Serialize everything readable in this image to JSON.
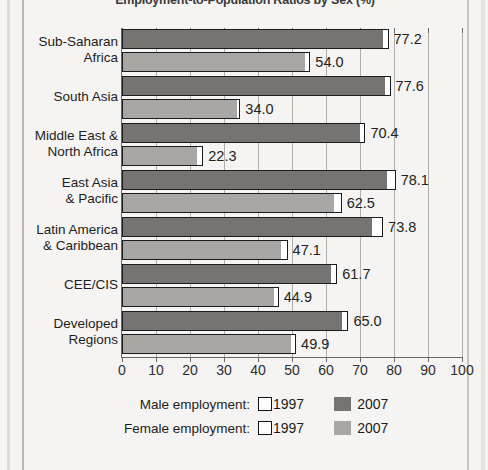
{
  "chart_title": "Employment-to-Population Ratios by Sex (%)",
  "chart_data": {
    "type": "bar",
    "orientation": "horizontal",
    "title": "Employment-to-Population Ratios by Sex (%)",
    "xlabel": "",
    "ylabel": "",
    "xlim": [
      0,
      100
    ],
    "xticks": [
      0,
      10,
      20,
      30,
      40,
      50,
      60,
      70,
      80,
      90,
      100
    ],
    "grid": true,
    "grid_axis": "x",
    "legend_position": "bottom",
    "categories": [
      "Sub-Saharan Africa",
      "South Asia",
      "Middle East & North Africa",
      "East Asia & Pacific",
      "Latin America & Caribbean",
      "CEE/CIS",
      "Developed Regions"
    ],
    "series": [
      {
        "name": "Male employment 2007",
        "sex": "male",
        "year": "2007",
        "color": "#767472",
        "values": [
          77.2,
          77.6,
          70.4,
          78.1,
          73.8,
          61.7,
          65.0
        ]
      },
      {
        "name": "Female employment 2007",
        "sex": "female",
        "year": "2007",
        "color": "#a9a7a5",
        "values": [
          54.0,
          34.0,
          22.3,
          62.5,
          47.1,
          44.9,
          49.9
        ]
      },
      {
        "name": "Male employment 1997",
        "sex": "male",
        "year": "1997",
        "color": "#ffffff",
        "values": [
          78.4,
          79.0,
          71.6,
          80.5,
          76.8,
          63.3,
          66.6
        ]
      },
      {
        "name": "Female employment 1997",
        "sex": "female",
        "year": "1997",
        "color": "#ffffff",
        "values": [
          55.4,
          34.8,
          23.9,
          64.6,
          48.7,
          46.1,
          51.2
        ]
      }
    ],
    "data_labels": [
      "77.2",
      "54.0",
      "77.6",
      "34.0",
      "70.4",
      "22.3",
      "78.1",
      "62.5",
      "73.8",
      "47.1",
      "61.7",
      "44.9",
      "65.0",
      "49.9"
    ]
  },
  "categories": [
    {
      "line1": "Sub-Saharan",
      "line2": "Africa"
    },
    {
      "line1": "South Asia",
      "line2": ""
    },
    {
      "line1": "Middle East &",
      "line2": "North Africa"
    },
    {
      "line1": "East Asia",
      "line2": "& Pacific"
    },
    {
      "line1": "Latin America",
      "line2": "& Caribbean"
    },
    {
      "line1": "CEE/CIS",
      "line2": ""
    },
    {
      "line1": "Developed",
      "line2": "Regions"
    }
  ],
  "bars": [
    {
      "label": "77.2",
      "value_2007": 77.2,
      "value_1997": 78.4,
      "sex": "male",
      "category": "Sub-Saharan Africa"
    },
    {
      "label": "54.0",
      "value_2007": 54.0,
      "value_1997": 55.4,
      "sex": "female",
      "category": "Sub-Saharan Africa"
    },
    {
      "label": "77.6",
      "value_2007": 77.6,
      "value_1997": 79.0,
      "sex": "male",
      "category": "South Asia"
    },
    {
      "label": "34.0",
      "value_2007": 34.0,
      "value_1997": 34.8,
      "sex": "female",
      "category": "South Asia"
    },
    {
      "label": "70.4",
      "value_2007": 70.4,
      "value_1997": 71.6,
      "sex": "male",
      "category": "Middle East & North Africa"
    },
    {
      "label": "22.3",
      "value_2007": 22.3,
      "value_1997": 23.9,
      "sex": "female",
      "category": "Middle East & North Africa"
    },
    {
      "label": "78.1",
      "value_2007": 78.1,
      "value_1997": 80.5,
      "sex": "male",
      "category": "East Asia & Pacific"
    },
    {
      "label": "62.5",
      "value_2007": 62.5,
      "value_1997": 64.6,
      "sex": "female",
      "category": "East Asia & Pacific"
    },
    {
      "label": "73.8",
      "value_2007": 73.8,
      "value_1997": 76.8,
      "sex": "male",
      "category": "Latin America & Caribbean"
    },
    {
      "label": "47.1",
      "value_2007": 47.1,
      "value_1997": 48.7,
      "sex": "female",
      "category": "Latin America & Caribbean"
    },
    {
      "label": "61.7",
      "value_2007": 61.7,
      "value_1997": 63.3,
      "sex": "male",
      "category": "CEE/CIS"
    },
    {
      "label": "44.9",
      "value_2007": 44.9,
      "value_1997": 46.1,
      "sex": "female",
      "category": "CEE/CIS"
    },
    {
      "label": "65.0",
      "value_2007": 65.0,
      "value_1997": 66.6,
      "sex": "male",
      "category": "Developed Regions"
    },
    {
      "label": "49.9",
      "value_2007": 49.9,
      "value_1997": 51.2,
      "sex": "female",
      "category": "Developed Regions"
    }
  ],
  "xticks": [
    "0",
    "10",
    "20",
    "30",
    "40",
    "50",
    "60",
    "70",
    "80",
    "90",
    "100"
  ],
  "legend": {
    "rows": [
      {
        "title": "Male employment:",
        "swatch1_label": "1997",
        "swatch2_label": "2007",
        "swatch2_class": "male2007"
      },
      {
        "title": "Female employment:",
        "swatch1_label": "1997",
        "swatch2_label": "2007",
        "swatch2_class": "female2007"
      }
    ]
  }
}
